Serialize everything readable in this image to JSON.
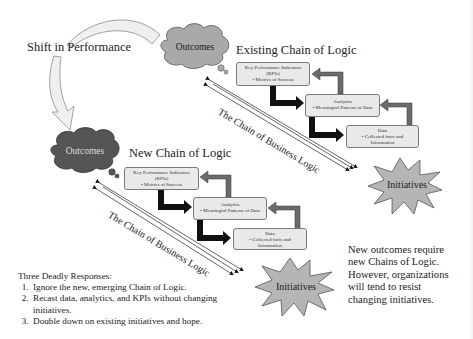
{
  "shift_label": "Shift in Performance",
  "existing": {
    "title": "Existing Chain of Logic",
    "outcomes": "Outcomes",
    "kpi": {
      "title": "Key Performance Indicators",
      "sub": "(KPIs)",
      "bullet": "• Metrics of Success"
    },
    "analytics": {
      "title": "Analytics",
      "bullet": "• Meaningful Patterns of Data"
    },
    "data": {
      "title": "Data",
      "bullet": "• Collected facts and",
      "bullet2": "Information"
    },
    "chain_label": "The Chain of Business Logic",
    "initiatives": "Initiatives"
  },
  "new": {
    "title": "New Chain of Logic",
    "outcomes": "Outcomes",
    "kpi": {
      "title": "Key Performance Indicators",
      "sub": "(KPIs)",
      "bullet": "• Metrics of Success"
    },
    "analytics": {
      "title": "Analytics",
      "bullet": "• Meaningful Patterns of Data"
    },
    "data": {
      "title": "Data",
      "bullet": "• Collected facts and",
      "bullet2": "Information"
    },
    "chain_label": "The Chain of Business Logic",
    "initiatives": "Initiatives"
  },
  "responses": {
    "title": "Three Deadly Responses:",
    "items": [
      "Ignore the new, emerging Chain of Logic.",
      "Recast data, analytics, and KPIs without changing initiatives.",
      "Double down on existing initiatives and hope."
    ]
  },
  "note": {
    "lines": [
      "New outcomes require",
      "new Chains of Logic.",
      "However, organizations",
      "will tend to resist",
      "changing initiatives."
    ]
  },
  "colors": {
    "cloud_existing": "#a9a9a9",
    "cloud_new": "#555555",
    "box_fill": "#e9e9e9",
    "starburst": "#b5b5b5",
    "return_arrow": "#6b6b6b",
    "forward_arrow": "#111111",
    "curved_arrow": "#efefef"
  }
}
